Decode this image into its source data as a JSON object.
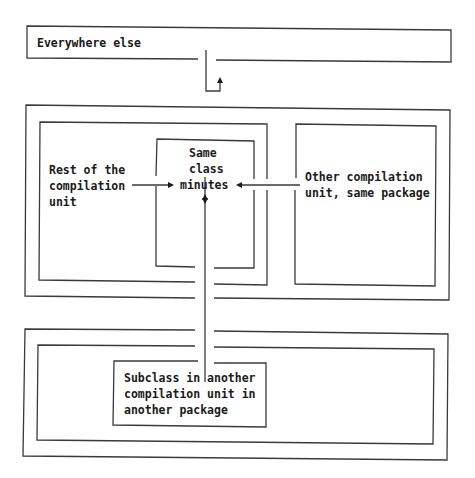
{
  "diagram": {
    "type": "access-scope-nesting",
    "labels": {
      "everywhere_else": "Everywhere else",
      "same_class": "Same\nclass",
      "member": "minutes",
      "rest_of_compilation_unit": "Rest of the\ncompilation\nunit",
      "other_compilation_unit": "Other compilation\nunit, same package",
      "subclass_other_package": "Subclass in another\ncompilation unit in\nanother package"
    },
    "colors": {
      "line": "#3a3a3a",
      "text": "#1a1a1a",
      "background": "#ffffff"
    },
    "regions": [
      {
        "id": "everywhere-else",
        "label": "Everywhere else"
      },
      {
        "id": "same-package",
        "children": [
          "compilation-unit",
          "other-compilation-unit"
        ]
      },
      {
        "id": "compilation-unit",
        "children": [
          "same-class"
        ]
      },
      {
        "id": "same-class",
        "contains": "minutes"
      },
      {
        "id": "other-package",
        "children": [
          "other-package-cu"
        ]
      },
      {
        "id": "other-package-cu",
        "children": [
          "subclass"
        ]
      }
    ],
    "arrows": [
      {
        "from": "Same class",
        "to": "minutes"
      },
      {
        "from": "Rest of the compilation unit",
        "to": "minutes"
      },
      {
        "from": "Other compilation unit, same package",
        "to": "minutes"
      },
      {
        "from": "Subclass in another compilation unit in another package",
        "to": "minutes"
      },
      {
        "from": "package boundary",
        "to": "Everywhere else",
        "style": "blocked-bent"
      }
    ]
  }
}
